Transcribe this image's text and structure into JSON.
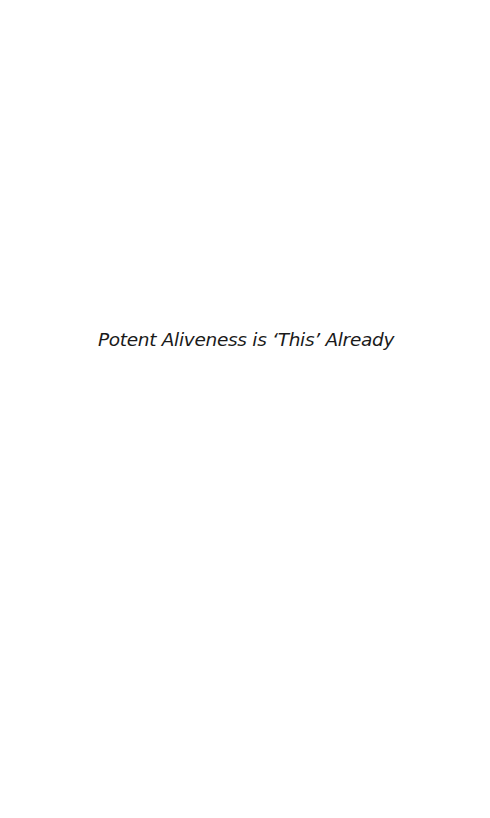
{
  "page": {
    "title": "Potent Aliveness is ‘This’ Already"
  }
}
